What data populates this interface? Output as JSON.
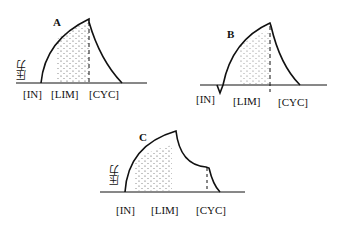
{
  "panels": [
    {
      "id": "A",
      "label": "A",
      "ylabel": "压力",
      "ticks": [
        "[IN]",
        "[LIM]",
        "[CYC]"
      ]
    },
    {
      "id": "B",
      "label": "B",
      "ticks": [
        "[IN]",
        "[LIM]",
        "[CYC]"
      ]
    },
    {
      "id": "C",
      "label": "C",
      "ylabel": "压力",
      "ticks": [
        "[IN]",
        "[LIM]",
        "[CYC]"
      ]
    }
  ],
  "colors": {
    "line": "#111111",
    "background": "#ffffff"
  }
}
